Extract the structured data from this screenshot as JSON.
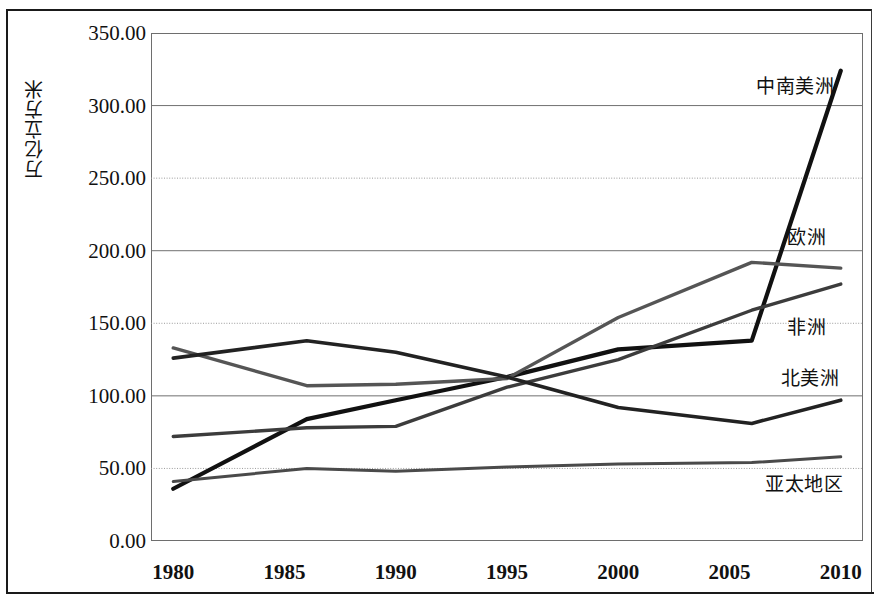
{
  "chart_data": {
    "type": "line",
    "title": "",
    "subtitle": "",
    "xlabel": "",
    "ylabel": "万亿立方米",
    "x": [
      1980,
      1985,
      1990,
      1995,
      2000,
      2005,
      2010
    ],
    "xlim": [
      1979,
      2011
    ],
    "ylim": [
      0,
      350
    ],
    "ytick_labels": [
      "350.00",
      "300.00",
      "250.00",
      "200.00",
      "150.00",
      "100.00",
      "50.00",
      "0.00"
    ],
    "ytick_values": [
      350,
      300,
      250,
      200,
      150,
      100,
      50,
      0
    ],
    "xtick_labels": [
      "1980",
      "1985",
      "1990",
      "1995",
      "2000",
      "2005",
      "2010"
    ],
    "grid": true,
    "legend_position": "right-inline",
    "series": [
      {
        "name": "中南美洲",
        "label_x": 2006.2,
        "label_y": 312,
        "color": "#111111",
        "width": 4.2,
        "points": [
          {
            "x": 1980,
            "y": 36
          },
          {
            "x": 1986,
            "y": 84
          },
          {
            "x": 1990,
            "y": 97
          },
          {
            "x": 1995,
            "y": 113
          },
          {
            "x": 2000,
            "y": 132
          },
          {
            "x": 2006,
            "y": 138
          },
          {
            "x": 2010,
            "y": 324
          }
        ]
      },
      {
        "name": "欧洲",
        "label_x": 2007.6,
        "label_y": 208,
        "color": "#555555",
        "width": 3.4,
        "points": [
          {
            "x": 1980,
            "y": 133
          },
          {
            "x": 1986,
            "y": 107
          },
          {
            "x": 1990,
            "y": 108
          },
          {
            "x": 1995,
            "y": 112
          },
          {
            "x": 2000,
            "y": 154
          },
          {
            "x": 2006,
            "y": 192
          },
          {
            "x": 2010,
            "y": 188
          }
        ]
      },
      {
        "name": "非洲",
        "label_x": 2007.6,
        "label_y": 146,
        "color": "#3c3c3c",
        "width": 3.4,
        "points": [
          {
            "x": 1980,
            "y": 72
          },
          {
            "x": 1986,
            "y": 78
          },
          {
            "x": 1990,
            "y": 79
          },
          {
            "x": 1995,
            "y": 106
          },
          {
            "x": 2000,
            "y": 125
          },
          {
            "x": 2006,
            "y": 159
          },
          {
            "x": 2010,
            "y": 177
          }
        ]
      },
      {
        "name": "北美洲",
        "label_x": 2007.3,
        "label_y": 111,
        "color": "#222222",
        "width": 3.6,
        "points": [
          {
            "x": 1980,
            "y": 126
          },
          {
            "x": 1986,
            "y": 138
          },
          {
            "x": 1990,
            "y": 130
          },
          {
            "x": 1995,
            "y": 113
          },
          {
            "x": 2000,
            "y": 92
          },
          {
            "x": 2006,
            "y": 81
          },
          {
            "x": 2010,
            "y": 97
          }
        ]
      },
      {
        "name": "亚太地区",
        "label_x": 2006.6,
        "label_y": 38,
        "color": "#4a4a4a",
        "width": 3.0,
        "points": [
          {
            "x": 1980,
            "y": 41
          },
          {
            "x": 1986,
            "y": 50
          },
          {
            "x": 1990,
            "y": 48
          },
          {
            "x": 1995,
            "y": 51
          },
          {
            "x": 2000,
            "y": 53
          },
          {
            "x": 2006,
            "y": 54
          },
          {
            "x": 2010,
            "y": 58
          }
        ]
      }
    ]
  }
}
